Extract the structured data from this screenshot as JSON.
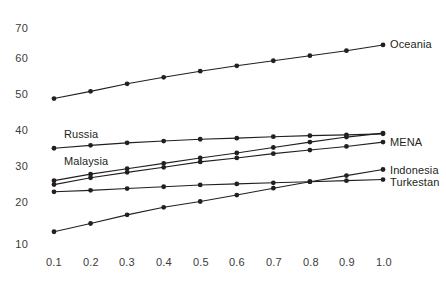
{
  "chart_data": {
    "type": "line",
    "title": "",
    "subtitle": "",
    "xlabel": "",
    "ylabel": "",
    "xlim": [
      0.05,
      1.05
    ],
    "ylim": [
      7,
      72
    ],
    "grid": false,
    "legend_position": "inline-right",
    "x": [
      0.1,
      0.2,
      0.3,
      0.4,
      0.5,
      0.6,
      0.7,
      0.8,
      0.9,
      1.0
    ],
    "x_tick_labels": [
      "0.1",
      "0.2",
      "0.3",
      "0.4",
      "0.5",
      "0.6",
      "0.7",
      "0.8",
      "0.9",
      "1.0"
    ],
    "y_tick_values": [
      10,
      20,
      30,
      40,
      50,
      60,
      70
    ],
    "y_tick_labels": [
      "10",
      "20",
      "30",
      "40",
      "50",
      "60",
      "70"
    ],
    "marker": "filled-circle",
    "line_color": "#231f20",
    "marker_color": "#231f20",
    "series": [
      {
        "name": "Oceania",
        "label_position": "right",
        "values": [
          50.4,
          52.4,
          54.5,
          56.3,
          58.0,
          59.5,
          60.9,
          62.3,
          63.7,
          65.3
        ]
      },
      {
        "name": "Russia",
        "label_position": "inner-top-left",
        "values": [
          36.6,
          37.4,
          38.1,
          38.6,
          39.1,
          39.4,
          39.8,
          40.1,
          40.3,
          40.6
        ]
      },
      {
        "name": "MENA",
        "label_position": "right",
        "values": [
          27.6,
          29.4,
          30.9,
          32.4,
          33.9,
          35.3,
          36.8,
          38.3,
          39.7,
          40.8
        ]
      },
      {
        "name": "Malaysia",
        "label_position": "inner-top-left",
        "values": [
          26.5,
          28.4,
          29.9,
          31.3,
          32.8,
          33.9,
          35.1,
          36.1,
          37.1,
          38.3
        ]
      },
      {
        "name": "Indonesia",
        "label_position": "right",
        "values": [
          13.4,
          15.7,
          18.1,
          20.2,
          21.8,
          23.6,
          25.5,
          27.3,
          29.0,
          30.7
        ]
      },
      {
        "name": "Turkestan",
        "label_position": "right",
        "values": [
          24.5,
          24.9,
          25.4,
          25.9,
          26.4,
          26.7,
          27.0,
          27.3,
          27.6,
          27.9
        ]
      }
    ]
  },
  "labels": {
    "oceania": "Oceania",
    "mena": "MENA",
    "indonesia": "Indonesia",
    "turkestan": "Turkestan",
    "russia": "Russia",
    "malaysia": "Malaysia"
  }
}
